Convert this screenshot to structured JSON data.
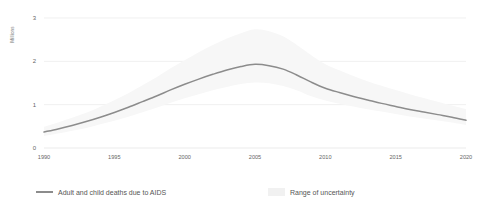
{
  "chart_data": {
    "type": "line",
    "title": "",
    "subtitle": "",
    "xlabel": "",
    "ylabel": "Millions",
    "xlim": [
      1990,
      2020
    ],
    "ylim": [
      0,
      3
    ],
    "grid": true,
    "legend_position": "bottom",
    "x": [
      1990,
      1991,
      1992,
      1993,
      1994,
      1995,
      1996,
      1997,
      1998,
      1999,
      2000,
      2001,
      2002,
      2003,
      2004,
      2005,
      2006,
      2007,
      2008,
      2009,
      2010,
      2011,
      2012,
      2013,
      2014,
      2015,
      2016,
      2017,
      2018,
      2019,
      2020
    ],
    "x_tick_labels": [
      "1990",
      "1995",
      "2000",
      "2005",
      "2010",
      "2015",
      "2020"
    ],
    "x_ticks": [
      1990,
      1995,
      2000,
      2005,
      2010,
      2015,
      2020
    ],
    "y_tick_labels": [
      "0",
      "1",
      "2",
      "3"
    ],
    "y_ticks": [
      0,
      1,
      2,
      3
    ],
    "series": [
      {
        "name": "Adult and child deaths due to AIDS",
        "color": "#8c8c8c",
        "values": [
          0.37,
          0.44,
          0.52,
          0.61,
          0.71,
          0.82,
          0.94,
          1.07,
          1.2,
          1.34,
          1.47,
          1.59,
          1.7,
          1.8,
          1.88,
          1.93,
          1.9,
          1.82,
          1.68,
          1.52,
          1.38,
          1.28,
          1.19,
          1.11,
          1.03,
          0.96,
          0.89,
          0.83,
          0.77,
          0.71,
          0.64
        ]
      }
    ],
    "uncertainty_band": {
      "name": "Range of uncertainty",
      "color": "#f1f1f1",
      "lower": [
        0.3,
        0.36,
        0.43,
        0.5,
        0.59,
        0.68,
        0.78,
        0.89,
        1.0,
        1.12,
        1.23,
        1.33,
        1.43,
        1.51,
        1.58,
        1.62,
        1.6,
        1.53,
        1.42,
        1.28,
        1.17,
        1.09,
        1.02,
        0.95,
        0.89,
        0.83,
        0.77,
        0.72,
        0.67,
        0.62,
        0.56
      ],
      "upper": [
        0.46,
        0.55,
        0.65,
        0.76,
        0.89,
        1.03,
        1.18,
        1.35,
        1.52,
        1.71,
        1.88,
        2.05,
        2.2,
        2.34,
        2.45,
        2.53,
        2.49,
        2.38,
        2.19,
        1.98,
        1.79,
        1.66,
        1.54,
        1.43,
        1.33,
        1.24,
        1.15,
        1.07,
        0.99,
        0.91,
        0.83
      ]
    }
  },
  "legend": {
    "items": [
      {
        "label": "Adult and child deaths due to AIDS",
        "swatch": "line",
        "color": "#8c8c8c"
      },
      {
        "label": "Range of uncertainty",
        "swatch": "band",
        "color": "#f1f1f1"
      }
    ]
  },
  "axes": {
    "y_label": "Millions",
    "y_ticks": [
      "3",
      "2",
      "1",
      "0"
    ],
    "x_ticks": [
      "1990",
      "1995",
      "2000",
      "2005",
      "2010",
      "2015",
      "2020"
    ]
  },
  "colors": {
    "line": "#8c8c8c",
    "band": "#f1f1f1",
    "grid": "#e9e9e9",
    "text": "#666666",
    "background": "#ffffff"
  }
}
